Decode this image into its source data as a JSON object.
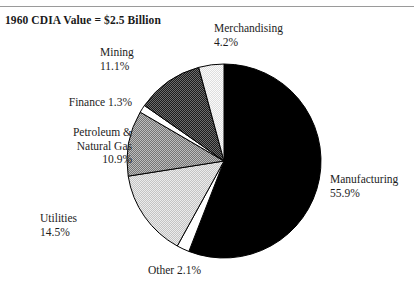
{
  "figure": {
    "title": "1960 CDIA Value = $2.5 Billion",
    "background_color": "#ffffff",
    "rule_color": "#9a9a9a"
  },
  "chart_data": {
    "type": "pie",
    "title": "1960 CDIA Value = $2.5 Billion",
    "xlabel": "",
    "ylabel": "",
    "units": "percent",
    "total_value": "$2.5 Billion",
    "start_angle_deg": 0,
    "direction": "clockwise",
    "legend": "none",
    "grid": false,
    "categories": [
      "Manufacturing",
      "Other",
      "Utilities",
      "Petroleum & Natural Gas",
      "Finance",
      "Mining",
      "Merchandising"
    ],
    "values": [
      55.9,
      2.1,
      14.5,
      10.9,
      1.3,
      11.1,
      4.2
    ],
    "slices": [
      {
        "name": "Manufacturing",
        "label": "Manufacturing",
        "value": 55.9,
        "value_text": "55.9%",
        "fill": "#000000",
        "pattern": "solid-black"
      },
      {
        "name": "Other",
        "label": "Other 2.1%",
        "value": 2.1,
        "value_text": "2.1%",
        "fill": "#ffffff",
        "pattern": "white"
      },
      {
        "name": "Utilities",
        "label": "Utilities",
        "value": 14.5,
        "value_text": "14.5%",
        "fill": "#d6d6d6",
        "pattern": "light-check"
      },
      {
        "name": "Petroleum & Natural Gas",
        "label": "Petroleum &\nNatural Gas",
        "value": 10.9,
        "value_text": "10.9%",
        "fill": "#9a9a9a",
        "pattern": "medium-check"
      },
      {
        "name": "Finance",
        "label": "Finance 1.3%",
        "value": 1.3,
        "value_text": "1.3%",
        "fill": "#fbfbfb",
        "pattern": "white"
      },
      {
        "name": "Mining",
        "label": "Mining",
        "value": 11.1,
        "value_text": "11.1%",
        "fill": "#3a3a3a",
        "pattern": "dark-check"
      },
      {
        "name": "Merchandising",
        "label": "Merchandising",
        "value": 4.2,
        "value_text": "4.2%",
        "fill": "#e8e8e8",
        "pattern": "very-light-check"
      }
    ]
  },
  "labels": {
    "merchandising": "Merchandising\n4.2%",
    "mining": "Mining\n11.1%",
    "finance": "Finance 1.3%",
    "petroleum": "Petroleum &\nNatural Gas\n10.9%",
    "utilities": "Utilities\n14.5%",
    "other": "Other 2.1%",
    "manufacturing": "Manufacturing\n55.9%"
  }
}
